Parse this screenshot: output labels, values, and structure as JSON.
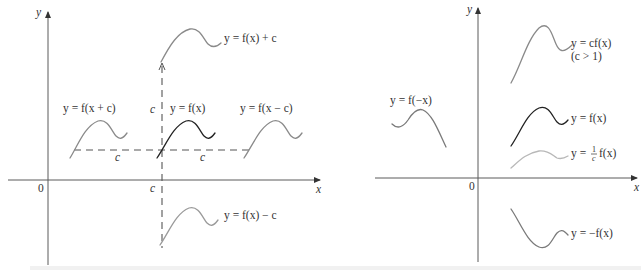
{
  "figure": {
    "left_panel": {
      "title": "Vertical and horizontal shifts",
      "axis_labels": {
        "y": "y",
        "x": "x",
        "origin": "0",
        "c_on_x_axis": "c"
      },
      "shift_labels": {
        "vertical": "c",
        "horizontal_left": "c",
        "horizontal_right": "c"
      },
      "curves": [
        {
          "id": "f-x-plus-c-vertical",
          "label": "y = f(x) + c",
          "color": "#8a8a8a"
        },
        {
          "id": "f-x-plus-c-horizontal",
          "label": "y = f(x + c)",
          "color": "#8a8a8a"
        },
        {
          "id": "f-x",
          "label": "y = f(x)",
          "color": "#222222"
        },
        {
          "id": "f-x-minus-c-horizontal",
          "label": "y = f(x − c)",
          "color": "#8a8a8a"
        },
        {
          "id": "f-x-minus-c-vertical",
          "label": "y = f(x) − c",
          "color": "#9a9a9a"
        }
      ]
    },
    "right_panel": {
      "title": "Stretches and reflections",
      "axis_labels": {
        "y": "y",
        "x": "x",
        "origin": "0"
      },
      "curves": [
        {
          "id": "c-f-x",
          "label": "y = cf(x)",
          "sublabel": "(c > 1)",
          "color": "#8a8a8a"
        },
        {
          "id": "f-neg-x",
          "label": "y = f(−x)",
          "color": "#7a7a7a"
        },
        {
          "id": "f-x",
          "label": "y = f(x)",
          "color": "#222222"
        },
        {
          "id": "one-over-c-f-x",
          "label_prefix": "y = ",
          "label_frac_num": "1",
          "label_frac_den": "c",
          "label_suffix": "f(x)",
          "color": "#b8b8b8"
        },
        {
          "id": "neg-f-x",
          "label": "y = −f(x)",
          "color": "#7a7a7a"
        }
      ]
    }
  }
}
